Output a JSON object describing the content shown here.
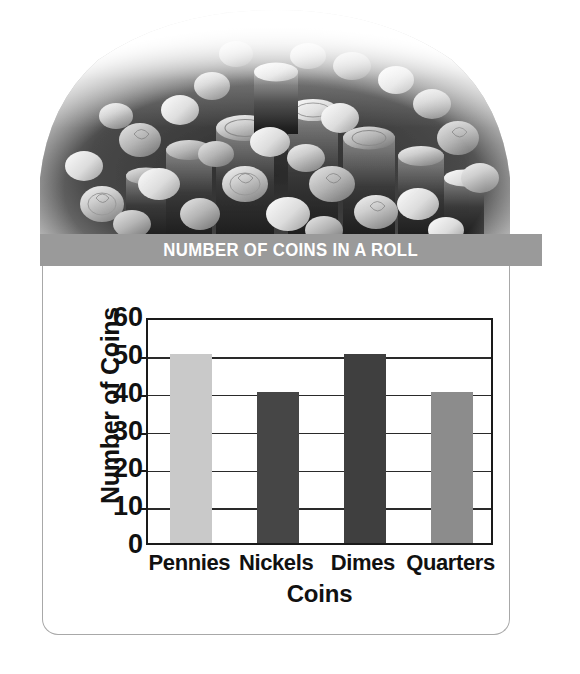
{
  "figure": {
    "title": "NUMBER OF COINS IN A ROLL",
    "photo_alt": "coins-photo",
    "banner_color": "#9a9a9a",
    "panel_border_color": "#a8a8a8"
  },
  "chart_data": {
    "type": "bar",
    "title": "NUMBER OF COINS IN A ROLL",
    "categories": [
      "Pennies",
      "Nickels",
      "Dimes",
      "Quarters"
    ],
    "values": [
      50,
      40,
      50,
      40
    ],
    "bar_colors": [
      "#c9c9c9",
      "#464646",
      "#3f3f3f",
      "#8c8c8c"
    ],
    "xlabel": "Coins",
    "ylabel": "Number of Coins",
    "ylim": [
      0,
      60
    ],
    "ytick_labels": [
      "60",
      "50",
      "40",
      "30",
      "20",
      "10",
      "0"
    ],
    "ytick_values": [
      60,
      50,
      40,
      30,
      20,
      10,
      0
    ],
    "ytick_step": 10,
    "grid": "horizontal",
    "legend": "none"
  }
}
